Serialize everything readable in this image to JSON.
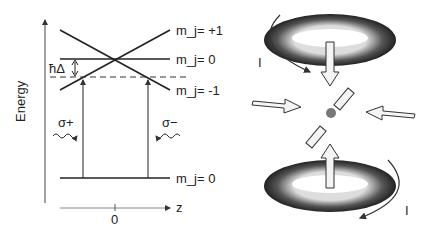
{
  "left_panel": {
    "y_axis_label": "Energy",
    "x_axis_label": "z",
    "x_tick": "0",
    "levels": {
      "plus1": "m_j= +1",
      "zero_excited": "m_j= 0",
      "minus1": "m_j= -1",
      "ground": "m_j= 0"
    },
    "detuning_label": "ħΔ",
    "sigma_plus": "σ+",
    "sigma_minus": "σ−"
  },
  "right_panel": {
    "current_top": "I",
    "current_bottom": "I"
  }
}
